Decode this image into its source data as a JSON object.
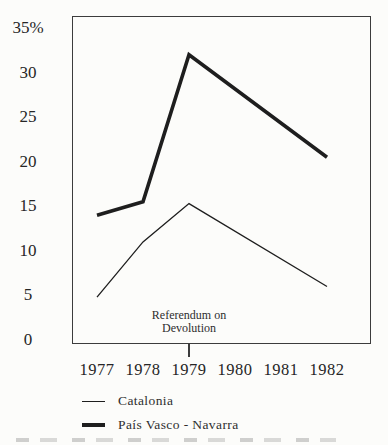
{
  "colors": {
    "ink": "#1e1e1e",
    "frame": "#3c3c3c",
    "background": "#fcfcfa"
  },
  "chart_data": {
    "type": "line",
    "title": "",
    "xlabel": "",
    "ylabel": "",
    "grid": false,
    "x_axis": {
      "ticks": [
        "1977",
        "1978",
        "1979",
        "1980",
        "1981",
        "1982"
      ],
      "tick_values": [
        1977,
        1978,
        1979,
        1980,
        1981,
        1982
      ]
    },
    "y_axis": {
      "unit": "%",
      "range": [
        0,
        35
      ],
      "ticks": [
        {
          "label": "35%",
          "value": 35
        },
        {
          "label": "30",
          "value": 30
        },
        {
          "label": "25",
          "value": 25
        },
        {
          "label": "20",
          "value": 20
        },
        {
          "label": "15",
          "value": 15
        },
        {
          "label": "10",
          "value": 10
        },
        {
          "label": "5",
          "value": 5
        },
        {
          "label": "0",
          "value": 0
        }
      ]
    },
    "series": [
      {
        "name": "Catalonia",
        "style": "thin",
        "x": [
          1977,
          1978,
          1979,
          1982
        ],
        "values": [
          4.8,
          11,
          15.3,
          6
        ]
      },
      {
        "name": "País Vasco - Navarra",
        "style": "thick",
        "x": [
          1977,
          1978,
          1979,
          1982
        ],
        "values": [
          14,
          15.5,
          32,
          20.5
        ]
      }
    ],
    "annotation": {
      "line1": "Referendum on",
      "line2": "Devolution",
      "x": 1979
    },
    "legend": [
      {
        "label": "Catalonia",
        "style": "thin"
      },
      {
        "label": "País Vasco - Navarra",
        "style": "thick"
      }
    ],
    "legend_position": "bottom-left"
  }
}
